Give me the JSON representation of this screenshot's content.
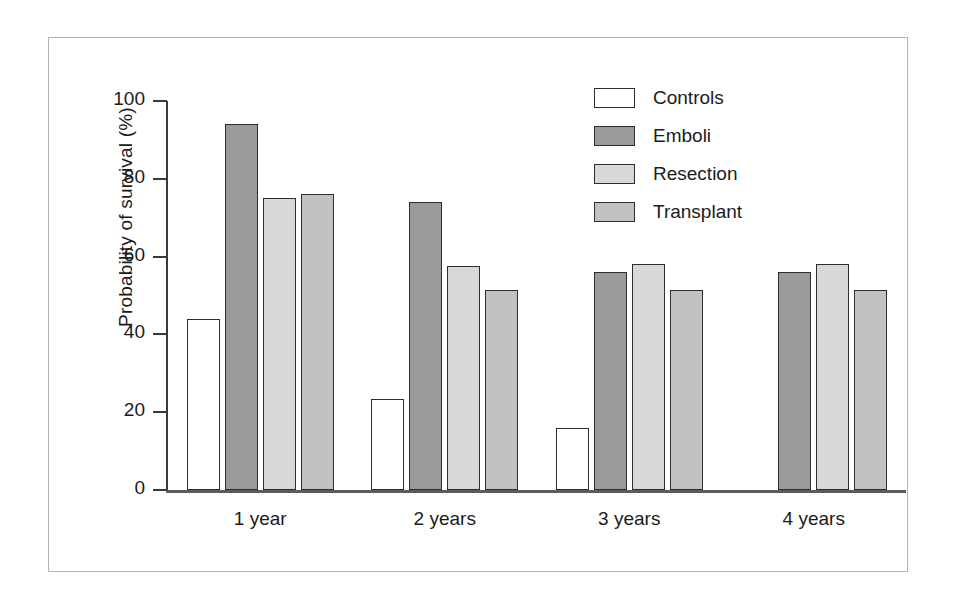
{
  "chart_data": {
    "type": "bar",
    "title": "",
    "xlabel": "",
    "ylabel": "Probability of survival (%)",
    "categories": [
      "1 year",
      "2 years",
      "3 years",
      "4 years"
    ],
    "ylim": [
      0,
      100
    ],
    "yticks": [
      0,
      20,
      40,
      60,
      80,
      100
    ],
    "ytick_labels": [
      "0",
      "20",
      "40",
      "60",
      "80",
      "100"
    ],
    "grid": false,
    "legend_position": "top-right",
    "series": [
      {
        "name": "Controls",
        "color": "#ffffff",
        "values": [
          44,
          23.5,
          16,
          null
        ]
      },
      {
        "name": "Emboli",
        "color": "#9a9a9a",
        "values": [
          94,
          74,
          56,
          56
        ]
      },
      {
        "name": "Resection",
        "color": "#d8d8d8",
        "values": [
          75,
          57.5,
          58,
          58
        ]
      },
      {
        "name": "Transplant",
        "color": "#c2c2c2",
        "values": [
          76,
          51.5,
          51.5,
          51.5
        ]
      }
    ]
  },
  "axes": {
    "y_title": "Probability of survival (%)",
    "y_tick_labels": [
      "100",
      "80",
      "60",
      "40",
      "20",
      "0"
    ],
    "x_tick_labels": [
      "1 year",
      "2 years",
      "3 years",
      "4 years"
    ]
  },
  "legend": {
    "items": [
      {
        "label": "Controls",
        "color": "#ffffff"
      },
      {
        "label": "Emboli",
        "color": "#9a9a9a"
      },
      {
        "label": "Resection",
        "color": "#d8d8d8"
      },
      {
        "label": "Transplant",
        "color": "#c2c2c2"
      }
    ]
  },
  "colors": {
    "controls": "#ffffff",
    "emboli": "#9a9a9a",
    "resection": "#d8d8d8",
    "transplant": "#c2c2c2",
    "bar_outline": "#2e2e2e",
    "axis": "#3a3a3a",
    "frame": "#b4b4b4",
    "text": "#1b1b1b"
  }
}
